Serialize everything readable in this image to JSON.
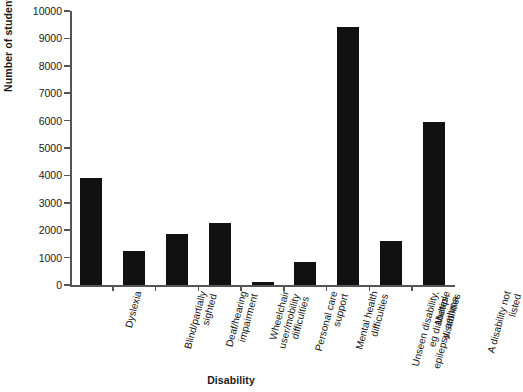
{
  "chart_data": {
    "type": "bar",
    "title": "",
    "xlabel": "Disability",
    "ylabel": "Number of students",
    "ylim": [
      0,
      10000
    ],
    "ytick_values": [
      0,
      1000,
      2000,
      3000,
      4000,
      5000,
      6000,
      7000,
      8000,
      9000,
      10000
    ],
    "ytick_labels": [
      "0",
      "1000",
      "2000",
      "3000",
      "4000",
      "5000",
      "6000",
      "7000",
      "8000",
      "9000",
      "10000"
    ],
    "grid": false,
    "legend": null,
    "bar_color": "#111111",
    "categories": [
      "Dyslexia",
      "Blind/partially sighted",
      "Deaf/hearing impairment",
      "Wheelchair user/mobility difficulties",
      "Personal care support",
      "Mental health difficulties",
      "Unseen disability, eg diabetes, epilepsy, asthma",
      "Multiple disabilities",
      "A disability not listed"
    ],
    "category_label_lines": [
      [
        "Dyslexia"
      ],
      [
        "Blind/partially",
        "sighted"
      ],
      [
        "Deaf/hearing",
        "impairment"
      ],
      [
        "Wheelchair",
        "user/mobility",
        "difficulties"
      ],
      [
        "Personal care",
        "support"
      ],
      [
        "Mental health",
        "difficulties"
      ],
      [
        "Unseen disability,",
        "eg diabetes,",
        "epilepsy, asthma"
      ],
      [
        "Multiple",
        "disabilities"
      ],
      [
        "A disability not",
        "listed"
      ]
    ],
    "values": [
      3900,
      1250,
      1850,
      2250,
      110,
      850,
      9400,
      1600,
      5950
    ]
  }
}
